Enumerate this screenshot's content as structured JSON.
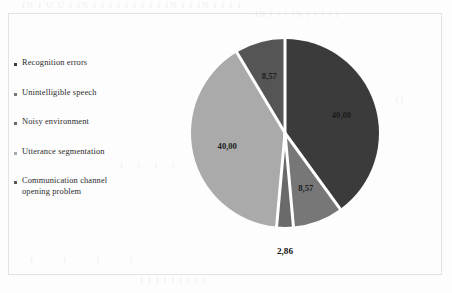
{
  "figure": {
    "frame_border_color": "#e2e2e2",
    "background": "#fdfdfd"
  },
  "bleed_through": {
    "line1": "IN I U U I IN  I I  I I I  I I I  I  IN I I IN I I I  I",
    "line2": "IN I I I IN  I I I I I",
    "line3": "I I I I I I I I I",
    "line4": "I I I I",
    "line5": "I I",
    "line6": "I I I I"
  },
  "legend": {
    "items": [
      {
        "label": "Recognition errors",
        "color": "#3b3b3b"
      },
      {
        "label": "Unintelligible speech",
        "color": "#777777"
      },
      {
        "label": "Noisy environment",
        "color": "#6a6a6a"
      },
      {
        "label": "Utterance segmentation",
        "color": "#aaaaaa"
      },
      {
        "label": "Communication channel\nopening problem",
        "color": "#555555"
      }
    ]
  },
  "chart_data": {
    "type": "pie",
    "title": "",
    "subtitle": "",
    "xlabel": "",
    "ylabel": "",
    "grid": false,
    "legend_position": "left",
    "value_suffix": "",
    "decimal_separator": ",",
    "start_angle_deg": 0,
    "direction": "clockwise",
    "separator_color": "#ffffff",
    "separator_width_px": 3,
    "categories": [
      "Recognition errors",
      "Unintelligible speech",
      "Noisy environment",
      "Utterance segmentation",
      "Communication channel opening problem"
    ],
    "values": [
      40.0,
      8.57,
      2.86,
      40.0,
      8.57
    ],
    "labels": [
      "40,00",
      "8,57",
      "2,86",
      "40,00",
      "8,57"
    ],
    "colors": [
      "#3b3b3b",
      "#777777",
      "#6a6a6a",
      "#aaaaaa",
      "#555555"
    ],
    "label_placement": [
      "inside",
      "inside",
      "outside",
      "inside",
      "inside"
    ],
    "total": 100.0
  }
}
